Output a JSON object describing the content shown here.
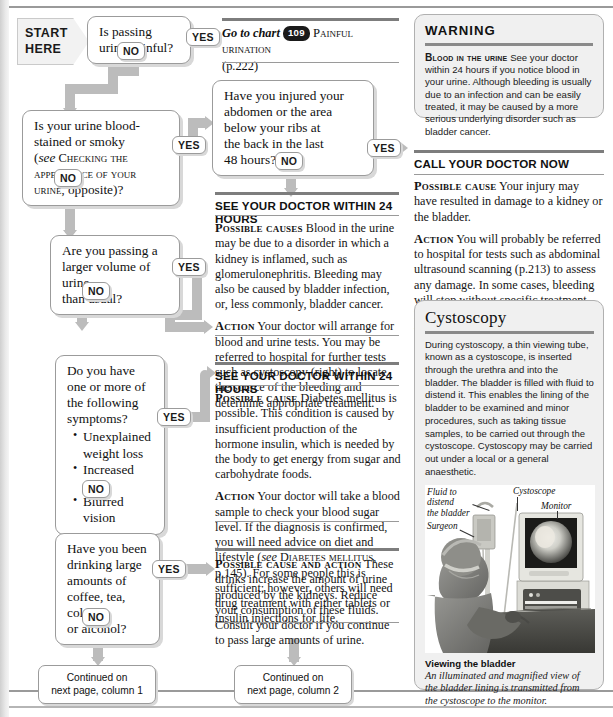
{
  "start": {
    "line1": "START",
    "line2": "HERE"
  },
  "questions": [
    {
      "id": "q1",
      "text": "Is passing\nurine painful?",
      "yes": "YES",
      "no": "NO"
    },
    {
      "id": "q2",
      "text_a": "Is your urine blood-\nstained or smoky\n(",
      "text_italic": "see",
      "text_sc": " Checking the appearance of your urine,",
      "text_b": " opposite)?",
      "yes": "YES",
      "no": "NO"
    },
    {
      "id": "q3",
      "text": "Have you injured your\nabdomen or the area\nbelow your ribs at\nthe back in the last\n48 hours?",
      "yes": "YES",
      "no": "NO"
    },
    {
      "id": "q4",
      "text": "Are you passing a\nlarger volume of urine\nthan usual?",
      "yes": "YES",
      "no": "NO"
    },
    {
      "id": "q5",
      "text": "Do you have\none or more of\nthe following\nsymptoms?",
      "bullets": [
        "Unexplained\nweight loss",
        "Increased\nthirst",
        "Blurred vision"
      ],
      "yes": "YES",
      "no": "NO"
    },
    {
      "id": "q6",
      "text": "Have you been\ndrinking large\namounts of\ncoffee, tea, cola,\nor alcohol?",
      "yes": "YES",
      "no": "NO"
    }
  ],
  "goto_chart": {
    "prefix": "Go to chart",
    "number": "109",
    "title": "Painful urination",
    "page": "(p.222)"
  },
  "advice": [
    {
      "id": "advice-blood",
      "heading": "SEE YOUR DOCTOR WITHIN 24 HOURS",
      "paras": [
        {
          "label": "Possible causes",
          "text": "Blood in the urine may be due to a disorder in which a kidney is inflamed, such as glomerulonephritis. Bleeding may also be caused by bladder infection, or, less commonly, bladder cancer."
        },
        {
          "label": "Action",
          "text": "Your doctor will arrange for blood and urine tests. You may be referred to hospital for further tests such as cystoscopy (right) to locate the source of the bleeding and determine appropriate treatment."
        }
      ]
    },
    {
      "id": "advice-diabetes",
      "heading": "SEE YOUR DOCTOR WITHIN 24 HOURS",
      "paras": [
        {
          "label": "Possible cause",
          "text": "Diabetes mellitus is possible. This condition is caused by insufficient production of the hormone insulin, which is needed by the body to get energy from sugar and carbohydrate foods."
        },
        {
          "label": "Action",
          "text_pre": "Your doctor will take a blood sample to check your blood sugar level. If the diagnosis is confirmed, you will need advice on diet and lifestyle (",
          "text_italic": "see",
          "text_sc": " Diabetes mellitus,",
          "text_post": " p.145). For some people this is sufficient; however, others will need drug treatment with either tablets or insulin injections for life."
        }
      ]
    },
    {
      "id": "advice-drinks",
      "heading": "",
      "paras": [
        {
          "label": "Possible cause and action",
          "text": "These drinks increase the amount of urine produced by the kidneys. Reduce your consumption of these fluids. Consult your doctor if you continue to pass large amounts of urine."
        }
      ]
    }
  ],
  "call_doctor": {
    "heading": "CALL YOUR DOCTOR NOW",
    "paras": [
      {
        "label": "Possible cause",
        "text": "Your injury may have resulted in damage to a kidney or the bladder."
      },
      {
        "label": "Action",
        "text": "You will probably be referred to hospital for tests such as abdominal ultrasound scanning (p.213) to assess any damage. In some cases, bleeding will stop without specific treatment. However, surgery may be needed if the damage is substantial."
      }
    ]
  },
  "warning": {
    "title": "WARNING",
    "label": "Blood in the urine",
    "text": "See your doctor within 24 hours if you notice blood in your urine. Although bleeding is usually due to an infection and can be easily treated, it may be caused by a more serious underlying disorder such as bladder cancer."
  },
  "cystoscopy": {
    "title": "Cystoscopy",
    "body": "During cystoscopy, a thin viewing tube, known as a cystoscope, is inserted through the urethra and into the bladder. The bladder is filled with fluid to distend it. This enables the lining of the bladder to be examined and minor procedures, such as taking tissue samples, to be carried out through the cystoscope. Cystoscopy may be carried out under a local or a general anaesthetic.",
    "labels": {
      "fluid": "Fluid to\ndistend\nthe bladder",
      "surgeon": "Surgeon",
      "cystoscope": "Cystoscope",
      "monitor": "Monitor"
    },
    "caption_title": "Viewing the bladder",
    "caption_body": "An illuminated and magnified view of the bladder lining is transmitted from the cystoscope to the monitor."
  },
  "continued": [
    {
      "id": "cont-col1",
      "text": "Continued on\nnext page, column 1"
    },
    {
      "id": "cont-col2",
      "text": "Continued on\nnext page, column 2"
    }
  ],
  "colors": {
    "pipe": "#bcbcbc",
    "panel": "#f0f0f0",
    "rule": "#7d7d7d"
  }
}
